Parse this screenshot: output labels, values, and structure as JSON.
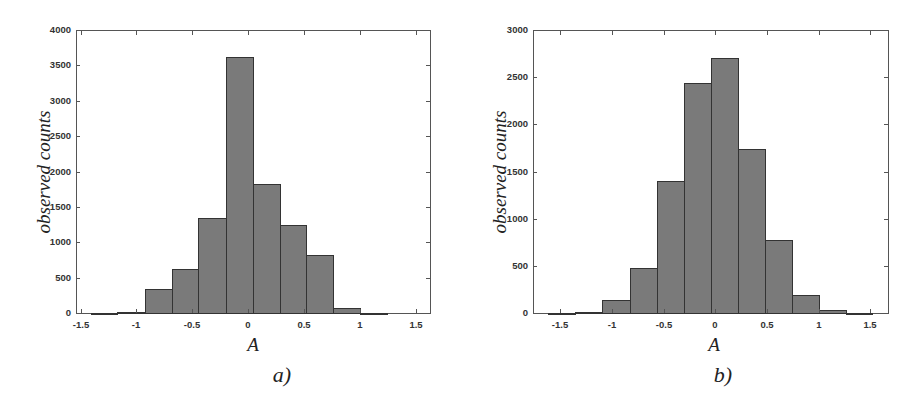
{
  "chart_data": [
    {
      "type": "bar",
      "subtype": "histogram",
      "caption": "a)",
      "title": "",
      "xlabel": "A",
      "ylabel": "observed counts",
      "xlim": [
        -1.55,
        1.6
      ],
      "ylim": [
        0,
        4000
      ],
      "xticks": [
        "-1.5",
        "-1",
        "-0.5",
        "0",
        "0.5",
        "1",
        "1.5"
      ],
      "xtick_values": [
        -1.5,
        -1,
        -0.5,
        0,
        0.5,
        1,
        1.5
      ],
      "yticks": [
        "0",
        "500",
        "1000",
        "1500",
        "2000",
        "2500",
        "3000",
        "3500",
        "4000"
      ],
      "ytick_values": [
        0,
        500,
        1000,
        1500,
        2000,
        2500,
        3000,
        3500,
        4000
      ],
      "grid": false,
      "bin_edges": [
        -1.41,
        -1.17,
        -0.92,
        -0.68,
        -0.44,
        -0.19,
        0.05,
        0.29,
        0.53,
        0.78,
        1.02,
        1.26
      ],
      "values": [
        5,
        30,
        350,
        640,
        1350,
        3630,
        1840,
        1260,
        830,
        80,
        10
      ]
    },
    {
      "type": "bar",
      "subtype": "histogram",
      "caption": "b)",
      "title": "",
      "xlabel": "A",
      "ylabel": "observed counts",
      "xlim": [
        -1.75,
        1.7
      ],
      "ylim": [
        0,
        3000
      ],
      "xticks": [
        "-1.5",
        "-1",
        "-0.5",
        "0",
        "0.5",
        "1",
        "1.5"
      ],
      "xtick_values": [
        -1.5,
        -1,
        -0.5,
        0,
        0.5,
        1,
        1.5
      ],
      "yticks": [
        "0",
        "500",
        "1000",
        "1500",
        "2000",
        "2500",
        "3000"
      ],
      "ytick_values": [
        0,
        500,
        1000,
        1500,
        2000,
        2500,
        3000
      ],
      "grid": false,
      "bin_edges": [
        -1.61,
        -1.35,
        -1.09,
        -0.83,
        -0.56,
        -0.3,
        -0.04,
        0.22,
        0.48,
        0.74,
        1.0,
        1.26,
        1.52
      ],
      "values": [
        10,
        25,
        145,
        490,
        1410,
        2450,
        2710,
        1750,
        780,
        200,
        40,
        10
      ]
    }
  ],
  "panels": [
    {
      "caption": "a)",
      "xlabel": "A",
      "ylabel": "observed counts",
      "frame": {
        "left": 76,
        "top": 30,
        "width": 355,
        "height": 284
      },
      "px_per_x": 111.5,
      "x_zero_px": 248,
      "ymax": 4000,
      "xticks": [
        {
          "label": "-1.5",
          "v": -1.5
        },
        {
          "label": "-1",
          "v": -1
        },
        {
          "label": "-0.5",
          "v": -0.5
        },
        {
          "label": "0",
          "v": 0
        },
        {
          "label": "0.5",
          "v": 0.5
        },
        {
          "label": "1",
          "v": 1
        },
        {
          "label": "1.5",
          "v": 1.5
        }
      ],
      "yticks": [
        {
          "label": "0",
          "v": 0
        },
        {
          "label": "500",
          "v": 500
        },
        {
          "label": "1000",
          "v": 1000
        },
        {
          "label": "1500",
          "v": 1500
        },
        {
          "label": "2000",
          "v": 2000
        },
        {
          "label": "2500",
          "v": 2500
        },
        {
          "label": "3000",
          "v": 3000
        },
        {
          "label": "3500",
          "v": 3500
        },
        {
          "label": "4000",
          "v": 4000
        }
      ],
      "bars": [
        {
          "x0": 91,
          "x1": 117,
          "count": 5
        },
        {
          "x0": 117,
          "x1": 145,
          "count": 30
        },
        {
          "x0": 145,
          "x1": 172,
          "count": 350
        },
        {
          "x0": 172,
          "x1": 198,
          "count": 640
        },
        {
          "x0": 198,
          "x1": 226,
          "count": 1350
        },
        {
          "x0": 226,
          "x1": 253,
          "count": 3630
        },
        {
          "x0": 253,
          "x1": 280,
          "count": 1840
        },
        {
          "x0": 280,
          "x1": 306,
          "count": 1260
        },
        {
          "x0": 306,
          "x1": 333,
          "count": 830
        },
        {
          "x0": 333,
          "x1": 360,
          "count": 80
        },
        {
          "x0": 360,
          "x1": 387,
          "count": 10
        }
      ],
      "xlabel_pos": {
        "left": 238,
        "top": 334
      },
      "caption_pos": {
        "left": 262,
        "top": 362
      },
      "ylabel_center": {
        "x": 44,
        "y": 172
      },
      "ytick_px": [
        313,
        278,
        242,
        207,
        172,
        136,
        101,
        65,
        30
      ],
      "xtick_px": [
        81,
        136,
        192,
        248,
        304,
        360,
        416
      ]
    },
    {
      "caption": "b)",
      "xlabel": "A",
      "ylabel": "observed counts",
      "frame": {
        "left": 533,
        "top": 30,
        "width": 356,
        "height": 284
      },
      "ymax": 3000,
      "xticks": [
        {
          "label": "-1.5",
          "v": -1.5
        },
        {
          "label": "-1",
          "v": -1
        },
        {
          "label": "-0.5",
          "v": -0.5
        },
        {
          "label": "0",
          "v": 0
        },
        {
          "label": "0.5",
          "v": 0.5
        },
        {
          "label": "1",
          "v": 1
        },
        {
          "label": "1.5",
          "v": 1.5
        }
      ],
      "yticks": [
        {
          "label": "0",
          "v": 0
        },
        {
          "label": "500",
          "v": 500
        },
        {
          "label": "1000",
          "v": 1000
        },
        {
          "label": "1500",
          "v": 1500
        },
        {
          "label": "2000",
          "v": 2000
        },
        {
          "label": "2500",
          "v": 2500
        },
        {
          "label": "3000",
          "v": 3000
        }
      ],
      "bars": [
        {
          "x0": 548,
          "x1": 575,
          "count": 10
        },
        {
          "x0": 575,
          "x1": 602,
          "count": 25
        },
        {
          "x0": 602,
          "x1": 630,
          "count": 145
        },
        {
          "x0": 630,
          "x1": 657,
          "count": 490
        },
        {
          "x0": 657,
          "x1": 684,
          "count": 1410
        },
        {
          "x0": 684,
          "x1": 711,
          "count": 2450
        },
        {
          "x0": 711,
          "x1": 738,
          "count": 2710
        },
        {
          "x0": 738,
          "x1": 765,
          "count": 1750
        },
        {
          "x0": 765,
          "x1": 792,
          "count": 780
        },
        {
          "x0": 792,
          "x1": 819,
          "count": 200
        },
        {
          "x0": 819,
          "x1": 846,
          "count": 40
        },
        {
          "x0": 846,
          "x1": 872,
          "count": 10
        }
      ],
      "xlabel_pos": {
        "left": 699,
        "top": 334
      },
      "caption_pos": {
        "left": 703,
        "top": 362
      },
      "ylabel_center": {
        "x": 500,
        "y": 172
      },
      "ytick_px": [
        313,
        266,
        219,
        172,
        124,
        77,
        30
      ],
      "xtick_px": [
        560,
        612,
        664,
        715,
        767,
        819,
        870
      ]
    }
  ]
}
